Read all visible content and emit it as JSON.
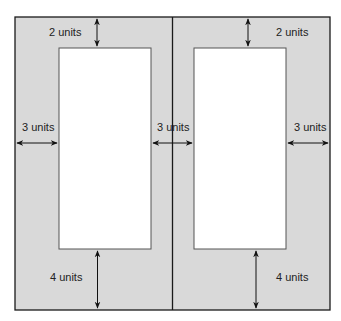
{
  "diagram": {
    "colors": {
      "margin_fill": "#d9d9d9",
      "page_fill": "#ffffff",
      "border": "#1a1a1a",
      "inner_border": "#555555",
      "arrow": "#111111",
      "text": "#222222"
    },
    "left_page": {
      "top_margin_label": "2 units",
      "outer_margin_label": "3 units",
      "inner_margin_label": "3 units",
      "bottom_margin_label": "4 units"
    },
    "right_page": {
      "top_margin_label": "2 units",
      "outer_margin_label": "3 units",
      "bottom_margin_label": "4 units"
    }
  }
}
